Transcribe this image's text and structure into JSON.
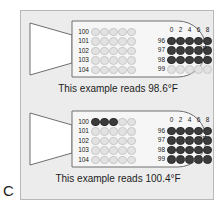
{
  "figure": {
    "letter": "C",
    "panel_bg": "#ececec",
    "border_color": "#b8b8b8",
    "dot_on_color": "#3b3b3b",
    "dot_off_color": "#e2e2e2",
    "unit_label": "°F"
  },
  "examples": [
    {
      "caption": "This example reads 98.6°F",
      "unit_label": "°F",
      "left_panel": {
        "row_labels": [
          "100",
          "101",
          "102",
          "103",
          "104"
        ],
        "rows_filled": [
          0,
          0,
          0,
          0,
          0
        ],
        "columns_per_row": 5
      },
      "right_panel": {
        "column_headers": [
          "0",
          "2",
          "4",
          "6",
          "8"
        ],
        "row_labels": [
          "96",
          "97",
          "98",
          "99"
        ],
        "rows_filled": [
          5,
          5,
          5,
          0
        ],
        "columns_per_row": 5
      }
    },
    {
      "caption": "This example reads 100.4°F",
      "unit_label": "°F",
      "left_panel": {
        "row_labels": [
          "100",
          "101",
          "102",
          "103",
          "104"
        ],
        "rows_filled": [
          3,
          0,
          0,
          0,
          0
        ],
        "columns_per_row": 5
      },
      "right_panel": {
        "column_headers": [
          "0",
          "2",
          "4",
          "6",
          "8"
        ],
        "row_labels": [
          "96",
          "97",
          "98",
          "99"
        ],
        "rows_filled": [
          5,
          5,
          5,
          5
        ],
        "columns_per_row": 5
      }
    }
  ]
}
